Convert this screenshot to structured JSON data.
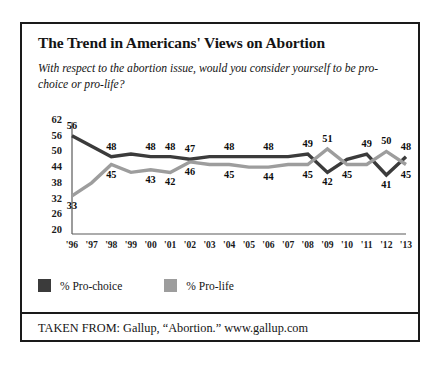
{
  "figure": {
    "title": "The Trend in Americans' Views on Abortion",
    "subtitle": "With respect to the abortion issue, would you consider  yourself to be pro-choice or pro-life?",
    "source": "TAKEN FROM: Gallup, “Abortion.” www.gallup.com"
  },
  "legend": {
    "items": [
      {
        "label": "% Pro-choice",
        "color": "#3b3b3b"
      },
      {
        "label": "% Pro-life",
        "color": "#9d9d9d"
      }
    ]
  },
  "chart_data": {
    "type": "line",
    "title": "The Trend in Americans' Views on Abortion",
    "subtitle": "With respect to the abortion issue, would you consider  yourself to be pro-choice or pro-life?",
    "xlabel": "",
    "ylabel": "",
    "categories": [
      "'96",
      "'97",
      "'98",
      "'99",
      "'00",
      "'01",
      "'02",
      "'03",
      "'04",
      "'05",
      "'06",
      "'07",
      "'08",
      "'09",
      "'10",
      "'11",
      "'12",
      "'13"
    ],
    "xtick_labels": [
      "'96",
      "'97",
      "'98",
      "'99",
      "'00",
      "'01",
      "'02",
      "'03",
      "'04",
      "'05",
      "'06",
      "'07",
      "'08",
      "'09",
      "'10",
      "'11",
      "'12",
      "'13"
    ],
    "ytick_labels": [
      "62",
      "56",
      "50",
      "44",
      "38",
      "32",
      "26",
      "20"
    ],
    "yticks": [
      62,
      56,
      50,
      44,
      38,
      32,
      26,
      20
    ],
    "ylim": [
      20,
      65
    ],
    "grid": false,
    "legend_position": "below-plot",
    "series": [
      {
        "name": "% Pro-choice",
        "color": "#3b3b3b",
        "values": [
          56,
          52,
          48,
          49,
          48,
          48,
          47,
          48,
          48,
          48,
          48,
          48,
          49,
          42,
          47,
          49,
          41,
          48
        ],
        "labels": [
          {
            "x": "'96",
            "value": 56,
            "text": "56",
            "side": "above"
          },
          {
            "x": "'98",
            "value": 48,
            "text": "48",
            "side": "above"
          },
          {
            "x": "'00",
            "value": 48,
            "text": "48",
            "side": "above"
          },
          {
            "x": "'01",
            "value": 48,
            "text": "48",
            "side": "above"
          },
          {
            "x": "'02",
            "value": 47,
            "text": "47",
            "side": "above"
          },
          {
            "x": "'04",
            "value": 48,
            "text": "48",
            "side": "above"
          },
          {
            "x": "'06",
            "value": 48,
            "text": "48",
            "side": "above"
          },
          {
            "x": "'08",
            "value": 49,
            "text": "49",
            "side": "above"
          },
          {
            "x": "'09",
            "value": 42,
            "text": "42",
            "side": "below"
          },
          {
            "x": "'11",
            "value": 49,
            "text": "49",
            "side": "above"
          },
          {
            "x": "'12",
            "value": 41,
            "text": "41",
            "side": "below"
          },
          {
            "x": "'13",
            "value": 48,
            "text": "48",
            "side": "above"
          }
        ]
      },
      {
        "name": "% Pro-life",
        "color": "#9d9d9d",
        "values": [
          33,
          38,
          45,
          42,
          43,
          42,
          46,
          45,
          45,
          44,
          44,
          45,
          45,
          51,
          45,
          45,
          50,
          45
        ],
        "labels": [
          {
            "x": "'96",
            "value": 33,
            "text": "33",
            "side": "below"
          },
          {
            "x": "'98",
            "value": 45,
            "text": "45",
            "side": "below"
          },
          {
            "x": "'00",
            "value": 43,
            "text": "43",
            "side": "below"
          },
          {
            "x": "'01",
            "value": 42,
            "text": "42",
            "side": "below"
          },
          {
            "x": "'02",
            "value": 46,
            "text": "46",
            "side": "below"
          },
          {
            "x": "'04",
            "value": 45,
            "text": "45",
            "side": "below"
          },
          {
            "x": "'06",
            "value": 44,
            "text": "44",
            "side": "below"
          },
          {
            "x": "'08",
            "value": 45,
            "text": "45",
            "side": "below"
          },
          {
            "x": "'09",
            "value": 51,
            "text": "51",
            "side": "above"
          },
          {
            "x": "'10",
            "value": 45,
            "text": "45",
            "side": "below"
          },
          {
            "x": "'12",
            "value": 50,
            "text": "50",
            "side": "above"
          },
          {
            "x": "'13",
            "value": 45,
            "text": "45",
            "side": "below"
          }
        ]
      }
    ]
  }
}
